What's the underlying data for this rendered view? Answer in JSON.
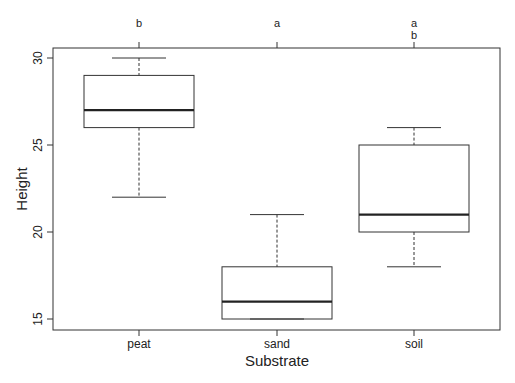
{
  "chart_data": {
    "type": "box",
    "title": "",
    "xlabel": "Substrate",
    "ylabel": "Height",
    "ylim": [
      14.4,
      30.6
    ],
    "yticks": [
      15,
      20,
      25,
      30
    ],
    "grid": false,
    "legend": null,
    "categories": [
      "peat",
      "sand",
      "soil"
    ],
    "boxes": [
      {
        "name": "peat",
        "whisker_low": 22,
        "q1": 26,
        "median": 27,
        "q3": 29,
        "whisker_high": 30,
        "letters": [
          "b"
        ]
      },
      {
        "name": "sand",
        "whisker_low": 15,
        "q1": 15,
        "median": 16,
        "q3": 18,
        "whisker_high": 21,
        "letters": [
          "a"
        ]
      },
      {
        "name": "soil",
        "whisker_low": 18,
        "q1": 20,
        "median": 21,
        "q3": 25,
        "whisker_high": 26,
        "letters": [
          "a",
          "b"
        ]
      }
    ],
    "annotations": [
      "b",
      "a",
      "a b"
    ]
  },
  "labels": {
    "xlabel": "Substrate",
    "ylabel": "Height",
    "yticks": [
      "15",
      "20",
      "25",
      "30"
    ],
    "xticks": [
      "peat",
      "sand",
      "soil"
    ],
    "letters": {
      "peat": [
        "b"
      ],
      "sand": [
        "a"
      ],
      "soil": [
        "a",
        "b"
      ]
    }
  }
}
